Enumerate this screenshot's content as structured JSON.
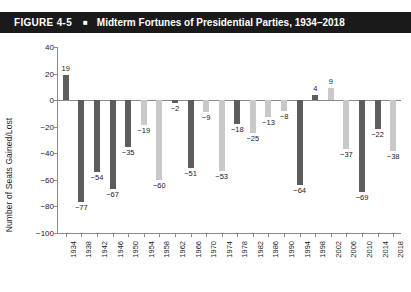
{
  "header": {
    "figure_number": "FIGURE 4-5",
    "bullet": "■",
    "title": "Midterm Fortunes of Presidential Parties, 1934–2018"
  },
  "legend": {
    "items": [
      {
        "label": "Democratic Presidents",
        "color": "#5d5d5d",
        "key": "dem"
      },
      {
        "label": "Republican Presidents",
        "color": "#c9c9c9",
        "key": "rep"
      }
    ]
  },
  "colors": {
    "democratic": "#5d5d5d",
    "republican": "#c9c9c9",
    "banner": "#1a1a1a",
    "axis": "#8a8a8a",
    "text": "#222222"
  },
  "chart_data": {
    "type": "bar",
    "title": "Midterm Fortunes of Presidential Parties, 1934–2018",
    "xlabel": "",
    "ylabel": "Number of Seats Gained/Lost",
    "ylim": [
      -100,
      40
    ],
    "ytick_step": 20,
    "yticks": [
      "40",
      "20",
      "0",
      "−20",
      "−40",
      "−60",
      "−80",
      "−100"
    ],
    "grid": false,
    "legend_position": "bottom",
    "categories": [
      "1934",
      "1938",
      "1942",
      "1946",
      "1950",
      "1954",
      "1958",
      "1962",
      "1966",
      "1970",
      "1974",
      "1978",
      "1982",
      "1986",
      "1990",
      "1994",
      "1998",
      "2002",
      "2006",
      "2010",
      "2014",
      "2018"
    ],
    "values": [
      19,
      -77,
      -54,
      -67,
      -35,
      -19,
      -60,
      -2,
      -51,
      -9,
      -53,
      -18,
      -25,
      -13,
      -8,
      -64,
      4,
      9,
      -37,
      -69,
      -22,
      -38
    ],
    "value_labels": [
      "19",
      "−77",
      "−54",
      "−67",
      "−35",
      "−19",
      "−60",
      "−2",
      "−51",
      "−9",
      "−53",
      "−18",
      "−25",
      "−13",
      "−8",
      "−64",
      "4",
      "9",
      "−37",
      "−69",
      "−22",
      "−38"
    ],
    "party": [
      "dem",
      "dem",
      "dem",
      "dem",
      "dem",
      "rep",
      "rep",
      "dem",
      "dem",
      "rep",
      "rep",
      "dem",
      "rep",
      "rep",
      "rep",
      "dem",
      "dem",
      "rep",
      "rep",
      "dem",
      "dem",
      "rep"
    ],
    "series": [
      {
        "name": "Democratic Presidents",
        "color": "#5d5d5d",
        "points": [
          {
            "x": "1934",
            "y": 19
          },
          {
            "x": "1938",
            "y": -77
          },
          {
            "x": "1942",
            "y": -54
          },
          {
            "x": "1946",
            "y": -67
          },
          {
            "x": "1950",
            "y": -35
          },
          {
            "x": "1962",
            "y": -2
          },
          {
            "x": "1966",
            "y": -51
          },
          {
            "x": "1978",
            "y": -18
          },
          {
            "x": "1994",
            "y": -64
          },
          {
            "x": "1998",
            "y": 4
          },
          {
            "x": "2010",
            "y": -69
          },
          {
            "x": "2014",
            "y": -22
          }
        ]
      },
      {
        "name": "Republican Presidents",
        "color": "#c9c9c9",
        "points": [
          {
            "x": "1954",
            "y": -19
          },
          {
            "x": "1958",
            "y": -60
          },
          {
            "x": "1970",
            "y": -9
          },
          {
            "x": "1974",
            "y": -53
          },
          {
            "x": "1982",
            "y": -25
          },
          {
            "x": "1986",
            "y": -13
          },
          {
            "x": "1990",
            "y": -8
          },
          {
            "x": "2002",
            "y": 9
          },
          {
            "x": "2006",
            "y": -37
          },
          {
            "x": "2018",
            "y": -38
          }
        ]
      }
    ]
  }
}
